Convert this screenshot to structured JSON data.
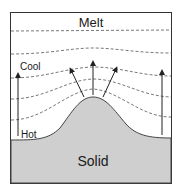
{
  "labels": {
    "top": "Melt",
    "bottom": "Solid",
    "cool": "Cool",
    "hot": "Hot"
  },
  "colors": {
    "frame": "#333333",
    "solid_fill": "#cfcfcf",
    "dashed": "#555555",
    "arrow": "#222222"
  },
  "isotherms": 5,
  "arrows": [
    {
      "name": "left-temperature-arrow"
    },
    {
      "name": "growth-arrow-left"
    },
    {
      "name": "growth-arrow-center"
    },
    {
      "name": "growth-arrow-right"
    },
    {
      "name": "right-temperature-arrow"
    }
  ]
}
